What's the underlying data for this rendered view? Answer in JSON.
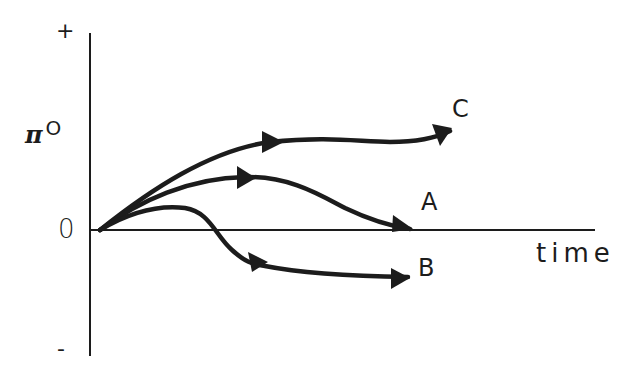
{
  "diagram": {
    "type": "phase-trajectory-sketch",
    "y_axis": {
      "top_label": "+",
      "bottom_label": "-",
      "zero_label": "0",
      "variable_symbol": "π",
      "variable_superscript": "O"
    },
    "x_axis": {
      "label": "time"
    },
    "curves": [
      {
        "id": "C",
        "label": "C",
        "description": "rises and levels off above zero, continuing upward slightly"
      },
      {
        "id": "A",
        "label": "A",
        "description": "rises then returns to zero"
      },
      {
        "id": "B",
        "label": "B",
        "description": "rises briefly then falls below zero and levels off negative"
      }
    ],
    "colors": {
      "background": "#ffffff",
      "ink": "#1c1c1c"
    }
  }
}
